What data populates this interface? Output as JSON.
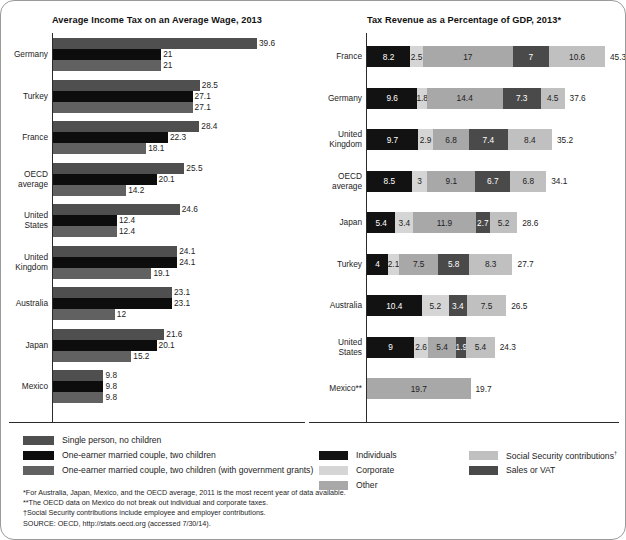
{
  "left": {
    "title": "Average Income Tax on an Average Wage, 2013",
    "legend": [
      {
        "label": "Single person, no children",
        "color": "#4f4f4f"
      },
      {
        "label": "One-earner married couple, two children",
        "color": "#0d0d0d"
      },
      {
        "label": "One-earner married couple, two children (with government grants)",
        "color": "#616161"
      }
    ]
  },
  "right": {
    "title": "Tax Revenue as a Percentage of GDP, 2013*",
    "legend": [
      {
        "label": "Individuals",
        "color": "#121212"
      },
      {
        "label": "Corporate",
        "color": "#d5d5d5"
      },
      {
        "label": "Other",
        "color": "#a8a8a8"
      },
      {
        "label": "Social Security contributions",
        "color": "#c0c0c0",
        "dagger": true
      },
      {
        "label": "Sales or VAT",
        "color": "#4a4a4a"
      }
    ]
  },
  "notes": [
    "*For Australia, Japan, Mexico, and the OECD average, 2011 is the most recent year of data available.",
    "**The OECD data on Mexico do not break out individual and corporate taxes.",
    "†Social Security contributions include employee and employer contributions.",
    "SOURCE: OECD, http://stats.oecd.org (accessed 7/30/14)."
  ],
  "chart_data": [
    {
      "type": "bar",
      "title": "Average Income Tax on an Average Wage, 2013",
      "orientation": "horizontal",
      "xlabel": "",
      "ylabel": "",
      "xlim": [
        0,
        39.6
      ],
      "grid": false,
      "legend_position": "bottom",
      "categories": [
        "Germany",
        "Turkey",
        "France",
        "OECD average",
        "United States",
        "United Kingdom",
        "Australia",
        "Japan",
        "Mexico"
      ],
      "series": [
        {
          "name": "Single person, no children",
          "color": "#4f4f4f",
          "values": [
            39.6,
            28.5,
            28.4,
            25.5,
            24.6,
            24.1,
            23.1,
            21.6,
            9.8
          ]
        },
        {
          "name": "One-earner married couple, two children",
          "color": "#0d0d0d",
          "values": [
            21,
            27.1,
            22.3,
            20.1,
            12.4,
            24.1,
            23.1,
            20.1,
            9.8
          ]
        },
        {
          "name": "One-earner married couple, two children (with government grants)",
          "color": "#616161",
          "values": [
            21,
            27.1,
            18.1,
            14.2,
            12.4,
            19.1,
            12,
            15.2,
            9.8
          ]
        }
      ]
    },
    {
      "type": "bar",
      "subtype": "stacked",
      "title": "Tax Revenue as a Percentage of GDP, 2013*",
      "orientation": "horizontal",
      "xlabel": "",
      "ylabel": "",
      "xlim": [
        0,
        45.3
      ],
      "grid": false,
      "legend_position": "bottom",
      "categories": [
        "France",
        "Germany",
        "United Kingdom",
        "OECD average",
        "Japan",
        "Turkey",
        "Australia",
        "United States",
        "Mexico**"
      ],
      "series": [
        {
          "name": "Individuals",
          "color": "#121212",
          "values": [
            8.2,
            9.6,
            9.7,
            8.5,
            5.4,
            4,
            10.4,
            9,
            null
          ]
        },
        {
          "name": "Corporate",
          "color": "#d5d5d5",
          "values": [
            2.5,
            1.8,
            2.9,
            3,
            3.4,
            2.1,
            5.2,
            2.6,
            null
          ]
        },
        {
          "name": "Other",
          "color": "#a8a8a8",
          "values": [
            17,
            14.4,
            6.8,
            9.1,
            11.9,
            7.5,
            null,
            5.4,
            19.7
          ]
        },
        {
          "name": "Sales or VAT",
          "color": "#4a4a4a",
          "values": [
            7,
            7.3,
            7.4,
            6.7,
            2.7,
            5.8,
            3.4,
            1.9,
            null
          ]
        },
        {
          "name": "Social Security contributions",
          "color": "#c0c0c0",
          "values": [
            10.6,
            4.5,
            8.4,
            6.8,
            5.2,
            8.3,
            7.5,
            5.4,
            null
          ]
        }
      ],
      "totals": [
        45.3,
        37.6,
        35.2,
        34.1,
        28.6,
        27.7,
        26.5,
        24.3,
        19.7
      ]
    }
  ]
}
